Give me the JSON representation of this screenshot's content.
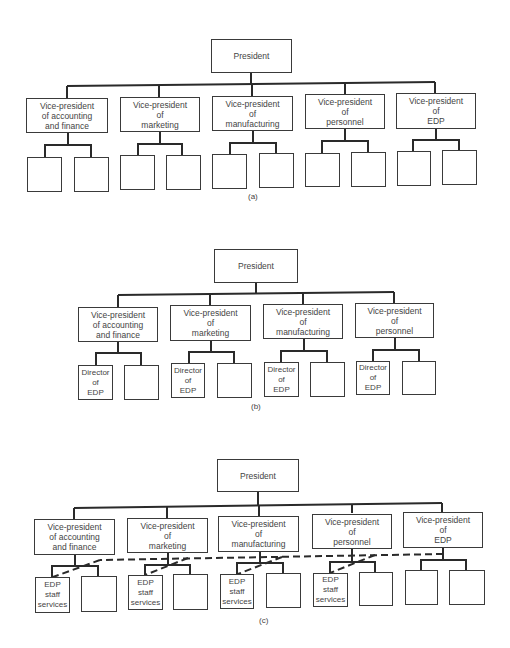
{
  "diagram_a": {
    "caption": "(a)",
    "president": "President",
    "vps": [
      {
        "label": "Vice-president\nof accounting\nand finance",
        "subs": [
          "",
          ""
        ]
      },
      {
        "label": "Vice-president\nof\nmarketing",
        "subs": [
          "",
          ""
        ]
      },
      {
        "label": "Vice-president\nof\nmanufacturing",
        "subs": [
          "",
          ""
        ]
      },
      {
        "label": "Vice-president\nof\npersonnel",
        "subs": [
          "",
          ""
        ]
      },
      {
        "label": "Vice-president\nof\nEDP",
        "subs": [
          "",
          ""
        ]
      }
    ]
  },
  "diagram_b": {
    "caption": "(b)",
    "president": "President",
    "vps": [
      {
        "label": "Vice-president\nof accounting\nand finance",
        "subs": [
          "Director\nof\nEDP",
          ""
        ]
      },
      {
        "label": "Vice-president\nof\nmarketing",
        "subs": [
          "Director\nof\nEDP",
          ""
        ]
      },
      {
        "label": "Vice-president\nof\nmanufacturing",
        "subs": [
          "Director\nof\nEDP",
          ""
        ]
      },
      {
        "label": "Vice-president\nof\npersonnel",
        "subs": [
          "Director\nof\nEDP",
          ""
        ]
      }
    ]
  },
  "diagram_c": {
    "caption": "(c)",
    "president": "President",
    "vps": [
      {
        "label": "Vice-president\nof accounting\nand finance",
        "subs": [
          "EDP\nstaff\nservices",
          ""
        ]
      },
      {
        "label": "Vice-president\nof\nmarketing",
        "subs": [
          "EDP\nstaff\nservices",
          ""
        ]
      },
      {
        "label": "Vice-president\nof\nmanufacturing",
        "subs": [
          "EDP\nstaff\nservices",
          ""
        ]
      },
      {
        "label": "Vice-president\nof\npersonnel",
        "subs": [
          "EDP\nstaff\nservices",
          ""
        ]
      },
      {
        "label": "Vice-president\nof\nEDP",
        "subs": [
          "",
          ""
        ]
      }
    ],
    "dashed_line": "dotted-line reporting from VP of EDP to EDP staff services"
  }
}
